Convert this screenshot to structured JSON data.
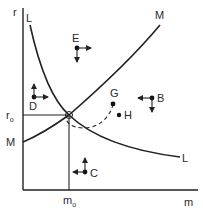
{
  "diagram": {
    "axes": {
      "y_label": "r",
      "x_label": "m"
    },
    "curves": [
      {
        "id": "L",
        "label_top": "L",
        "label_end": "L",
        "description": "downward sloping curve"
      },
      {
        "id": "M",
        "label_top": "M",
        "label_start": "M",
        "description": "upward sloping curve"
      }
    ],
    "equilibrium": {
      "r_label": "r",
      "r_sub": "o",
      "m_label": "m",
      "m_sub": "o"
    },
    "points": [
      {
        "id": "E",
        "label": "E",
        "arrows": [
          "right",
          "down"
        ]
      },
      {
        "id": "D",
        "label": "D",
        "arrows": [
          "up",
          "right"
        ]
      },
      {
        "id": "B",
        "label": "B",
        "arrows": [
          "left",
          "down"
        ]
      },
      {
        "id": "C",
        "label": "C",
        "arrows": [
          "up",
          "left"
        ]
      },
      {
        "id": "G",
        "label": "G",
        "arrows": []
      },
      {
        "id": "H",
        "label": "H",
        "arrows": []
      }
    ],
    "path": {
      "from": "G",
      "to": "equilibrium",
      "style": "dashed spiral"
    }
  }
}
